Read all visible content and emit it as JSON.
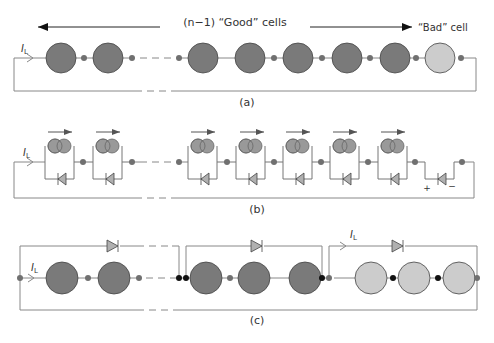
{
  "panels": {
    "a": {
      "caption": "(a)",
      "good_label": "(n−1) “Good” cells",
      "bad_label": "“Bad” cell",
      "current_label": "I",
      "current_sub": "L"
    },
    "b": {
      "caption": "(b)",
      "current_label": "I",
      "current_sub": "L",
      "plus": "+",
      "minus": "−"
    },
    "c": {
      "caption": "(c)",
      "current_label_left": "I",
      "current_sub_left": "L",
      "current_label_right": "I",
      "current_sub_right": "L"
    }
  },
  "colors": {
    "good_cell": "#7a7a7a",
    "bad_cell": "#cccccc",
    "wire": "#777777",
    "node": "#707070",
    "node_black": "#111111",
    "diode": "#b0b0b0"
  }
}
